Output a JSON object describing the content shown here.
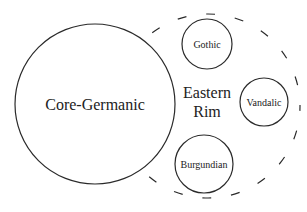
{
  "diagram": {
    "type": "nested-set-diagram",
    "colors": {
      "stroke": "#2a2a2a",
      "text": "#222222",
      "background": "#ffffff"
    },
    "core": {
      "label": "Core-Germanic",
      "cx": 95,
      "cy": 104,
      "r": 80
    },
    "rim": {
      "label_line1": "Eastern",
      "label_line2": "Rim",
      "cx": 208,
      "cy": 106,
      "r": 92,
      "style": "dashed"
    },
    "members": [
      {
        "label": "Gothic",
        "cx": 207,
        "cy": 44,
        "r": 25
      },
      {
        "label": "Vandalic",
        "cx": 264,
        "cy": 102,
        "r": 24
      },
      {
        "label": "Burgundian",
        "cx": 204,
        "cy": 164,
        "r": 29
      }
    ]
  }
}
